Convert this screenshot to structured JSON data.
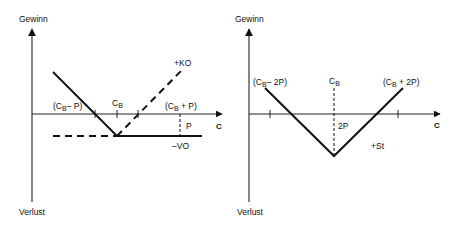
{
  "colors": {
    "line": "#111111",
    "axis": "#222222",
    "background": "#ffffff"
  },
  "left_chart": {
    "y_axis_top_label": "Gewinn",
    "y_axis_bottom_label": "Verlust",
    "x_axis_label": "C",
    "labels": {
      "cb_minus_p": "(C",
      "cb_minus_p_sub": "B",
      "cb_minus_p_tail": "– P)",
      "cb": "C",
      "cb_sub": "B",
      "cb_plus_p": "(C",
      "cb_plus_p_sub": "B",
      "cb_plus_p_tail": " + P)",
      "ko": "+KO",
      "p": "P",
      "vo": "–VO"
    }
  },
  "right_chart": {
    "y_axis_top_label": "Gewinn",
    "y_axis_bottom_label": "Verlust",
    "x_axis_label": "C",
    "labels": {
      "cb_minus_2p": "(C",
      "cb_minus_2p_sub": "B",
      "cb_minus_2p_tail": "– 2P)",
      "cb": "C",
      "cb_sub": "B",
      "cb_plus_2p": "(C",
      "cb_plus_2p_sub": "B",
      "cb_plus_2p_tail": " + 2P)",
      "two_p": "2P",
      "st": "+St"
    }
  }
}
